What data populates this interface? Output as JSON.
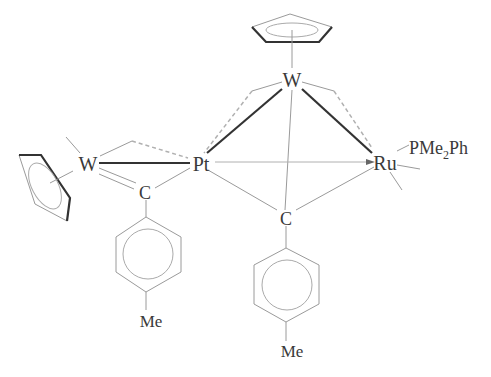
{
  "diagram": {
    "type": "chemical-structure",
    "atoms": {
      "w_top": "W",
      "w_left": "W",
      "pt": "Pt",
      "ru": "Ru",
      "c_left": "C",
      "c_center": "C",
      "me_left": "Me",
      "me_center": "Me",
      "ligand_p": "PMe",
      "ligand_sub": "2",
      "ligand_ph": "Ph"
    },
    "colors": {
      "text": "#3a3a3a",
      "thin_bond": "#9a9a9a",
      "bold_bond": "#333333",
      "dashed_bond": "#b0b0b0"
    }
  }
}
